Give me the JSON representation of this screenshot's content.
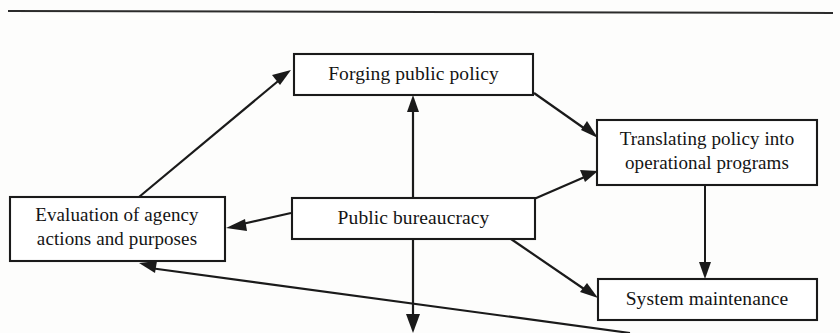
{
  "figure": {
    "title_rule": "horizontal-rule",
    "background_color": "#fdfdfc",
    "line_color": "#1a1a1a",
    "text_color": "#141414"
  },
  "nodes": {
    "forging": {
      "id": "forging-public-policy",
      "label": "Forging public policy",
      "lines": [
        "Forging public policy"
      ]
    },
    "translating": {
      "id": "translating-policy",
      "label": "Translating policy into operational programs",
      "lines": [
        "Translating policy into",
        "operational programs"
      ]
    },
    "bureaucracy": {
      "id": "public-bureaucracy",
      "label": "Public bureaucracy",
      "lines": [
        "Public bureaucracy"
      ]
    },
    "evaluation": {
      "id": "evaluation-of-agency",
      "label": "Evaluation of agency actions and purposes",
      "lines": [
        "Evaluation of agency",
        "actions and purposes"
      ]
    },
    "maintenance": {
      "id": "system-maintenance",
      "label": "System maintenance",
      "lines": [
        "System maintenance"
      ]
    }
  },
  "edges": [
    {
      "id": "evaluation-to-forging",
      "from": "evaluation",
      "to": "forging",
      "direction": "up-right"
    },
    {
      "id": "forging-to-translating",
      "from": "forging",
      "to": "translating",
      "direction": "down-right"
    },
    {
      "id": "bureaucracy-to-forging",
      "from": "bureaucracy",
      "to": "forging",
      "direction": "up"
    },
    {
      "id": "bureaucracy-to-evaluation",
      "from": "bureaucracy",
      "to": "evaluation",
      "direction": "left"
    },
    {
      "id": "bureaucracy-to-translating",
      "from": "bureaucracy",
      "to": "translating",
      "direction": "up-right"
    },
    {
      "id": "bureaucracy-to-maintenance",
      "from": "bureaucracy",
      "to": "maintenance",
      "direction": "down-right"
    },
    {
      "id": "translating-to-maintenance",
      "from": "translating",
      "to": "maintenance",
      "direction": "down"
    },
    {
      "id": "maintenance-to-evaluation",
      "from": "maintenance",
      "to": "evaluation",
      "direction": "up-left"
    },
    {
      "id": "bureaucracy-downward",
      "from": "bureaucracy",
      "to": "offscreen-bottom",
      "direction": "down"
    }
  ]
}
